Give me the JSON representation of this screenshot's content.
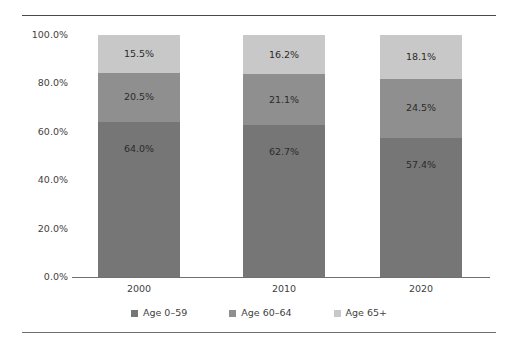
{
  "chart_data": {
    "type": "bar",
    "subtype": "stacked-percent",
    "title": "",
    "subtitle": "",
    "xlabel": "",
    "ylabel": "",
    "categories": [
      "2000",
      "2010",
      "2020"
    ],
    "series": [
      {
        "name": "Age 0–59",
        "color": "#767676",
        "values": [
          64.0,
          62.7,
          57.4
        ],
        "labels": [
          "64.0%",
          "62.7%",
          "57.4%"
        ]
      },
      {
        "name": "Age 60–64",
        "color": "#8f8f8f",
        "values": [
          20.5,
          21.1,
          24.5
        ],
        "labels": [
          "20.5%",
          "21.1%",
          "24.5%"
        ]
      },
      {
        "name": "Age 65+",
        "color": "#c8c8c8",
        "values": [
          15.5,
          16.2,
          18.1
        ],
        "labels": [
          "15.5%",
          "16.2%",
          "18.1%"
        ]
      }
    ],
    "ylim": [
      0,
      100
    ],
    "yticks": [
      0,
      20,
      40,
      60,
      80,
      100
    ],
    "ytick_labels": [
      "0.0%",
      "20.0%",
      "40.0%",
      "60.0%",
      "80.0%",
      "100.0%"
    ],
    "grid": false,
    "legend_position": "bottom"
  },
  "axis": {
    "y_labels": [
      "100.0%",
      "80.0%",
      "60.0%",
      "40.0%",
      "20.0%",
      "0.0%"
    ],
    "x_labels": [
      "2000",
      "2010",
      "2020"
    ]
  },
  "legend": {
    "items": [
      {
        "label": "Age 0–59",
        "color": "#767676"
      },
      {
        "label": "Age 60–64",
        "color": "#8f8f8f"
      },
      {
        "label": "Age 65+",
        "color": "#c8c8c8"
      }
    ]
  },
  "bars": [
    {
      "category": "2000",
      "segments": [
        {
          "series": "Age 65+",
          "label": "15.5%",
          "value": 15.5,
          "color": "#c8c8c8"
        },
        {
          "series": "Age 60–64",
          "label": "20.5%",
          "value": 20.5,
          "color": "#8f8f8f"
        },
        {
          "series": "Age 0–59",
          "label": "64.0%",
          "value": 64.0,
          "color": "#767676"
        }
      ]
    },
    {
      "category": "2010",
      "segments": [
        {
          "series": "Age 65+",
          "label": "16.2%",
          "value": 16.2,
          "color": "#c8c8c8"
        },
        {
          "series": "Age 60–64",
          "label": "21.1%",
          "value": 21.1,
          "color": "#8f8f8f"
        },
        {
          "series": "Age 0–59",
          "label": "62.7%",
          "value": 62.7,
          "color": "#767676"
        }
      ]
    },
    {
      "category": "2020",
      "segments": [
        {
          "series": "Age 65+",
          "label": "18.1%",
          "value": 18.1,
          "color": "#c8c8c8"
        },
        {
          "series": "Age 60–64",
          "label": "24.5%",
          "value": 24.5,
          "color": "#8f8f8f"
        },
        {
          "series": "Age 0–59",
          "label": "57.4%",
          "value": 57.4,
          "color": "#767676"
        }
      ]
    }
  ]
}
